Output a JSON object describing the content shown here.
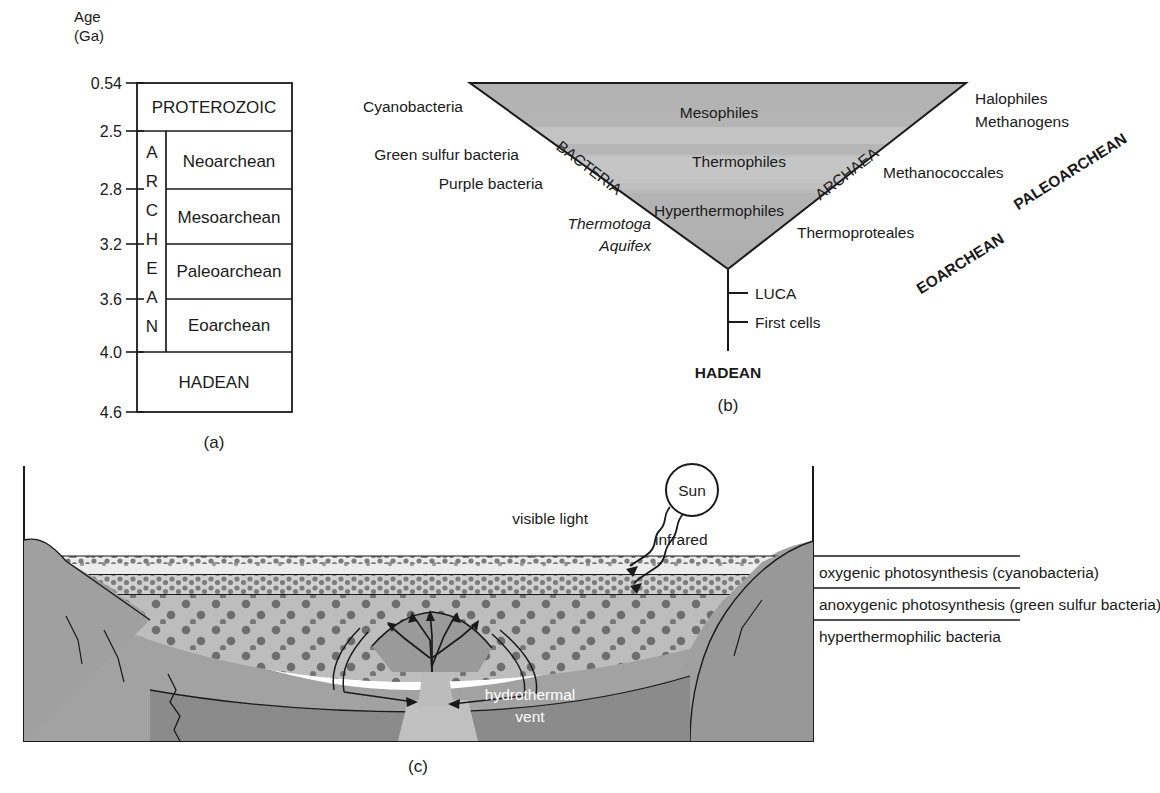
{
  "figure": {
    "panels": [
      {
        "id": "a",
        "caption": "(a)"
      },
      {
        "id": "b",
        "caption": "(b)"
      },
      {
        "id": "c",
        "caption": "(c)"
      }
    ]
  },
  "panel_a": {
    "axis_label_line1": "Age",
    "axis_label_line2": "(Ga)",
    "ticks": [
      "0.54",
      "2.5",
      "2.8",
      "3.2",
      "3.6",
      "4.0",
      "4.6"
    ],
    "eon_proterozoic": "PROTEROZOIC",
    "eon_hadean": "HADEAN",
    "archean_letters": [
      "A",
      "R",
      "C",
      "H",
      "E",
      "A",
      "N"
    ],
    "archean_label": "ARCHEAN",
    "eras": [
      "Neoarchean",
      "Mesoarchean",
      "Paleoarchean",
      "Eoarchean"
    ]
  },
  "panel_b": {
    "domain_left": "BACTERIA",
    "domain_right": "ARCHAEA",
    "interior_labels": [
      "Mesophiles",
      "Thermophiles",
      "Hyperthermophiles"
    ],
    "left_taxa": [
      "Cyanobacteria",
      "Green sulfur bacteria",
      "Purple bacteria"
    ],
    "left_taxa_italic": [
      "Thermotoga",
      "Aquifex"
    ],
    "right_taxa": [
      "Halophiles",
      "Methanogens",
      "Methanococcales",
      "Thermoproteales"
    ],
    "stem_nodes": [
      "LUCA",
      "First cells"
    ],
    "eon_label": "HADEAN",
    "era_paleoarchean": "PALEOARCHEAN",
    "era_eoarchean": "EOARCHEAN"
  },
  "panel_c": {
    "sun_label": "Sun",
    "ray_visible": "visible light",
    "ray_infrared": "infrared",
    "vent_label_line1": "hydrothermal",
    "vent_label_line2": "vent",
    "layer_labels": [
      "oxygenic photosynthesis (cyanobacteria)",
      "anoxygenic photosynthesis (green sulfur bacteria)",
      "hyperthermophilic bacteria"
    ]
  },
  "colors": {
    "ink": "#1a1a1a",
    "triangle_top": "#b4b4b4",
    "triangle_mid": "#c4c4c4",
    "triangle_low": "#b0b0b0",
    "rock_light": "#a0a0a0",
    "rock_dark": "#8a8a8a",
    "magma": "#b8b8b8",
    "layer_top": "#ebebeb",
    "layer_mid": "#d2d2d2",
    "layer_bot": "#bdbdbd",
    "white_seam": "#ffffff"
  }
}
